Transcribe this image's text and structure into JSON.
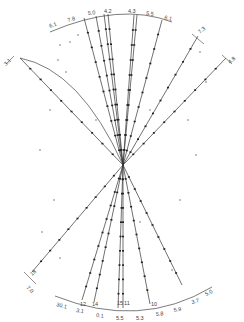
{
  "diagram": {
    "type": "track-fan",
    "vertex": {
      "x": 123,
      "y": 165
    },
    "stroke_color": "#333333",
    "dot_color": "#222222",
    "top_arc_labels": [
      "6.1",
      "7.8",
      "5.0",
      "4.2",
      "4.3",
      "5.5",
      "6.1"
    ],
    "bottom_arc_labels": [
      "30.1",
      "3.1",
      "0.1",
      "5.5",
      "5.3",
      "5.8",
      "5.9",
      "3.7",
      "5.0"
    ],
    "side_labels": {
      "upper_left": "3.1",
      "upper_right_1": "7.3",
      "upper_right_2": "4.8",
      "lower_left_1": "18",
      "lower_left_2": "7.0"
    },
    "inner_bottom_labels": [
      "12",
      "14",
      "15",
      "11",
      "10"
    ],
    "tracks_top": [
      {
        "x": 84,
        "y": 18
      },
      {
        "x": 96,
        "y": 16
      },
      {
        "x": 104,
        "y": 14
      },
      {
        "x": 108,
        "y": 14
      },
      {
        "x": 134,
        "y": 15
      },
      {
        "x": 137,
        "y": 15
      },
      {
        "x": 162,
        "y": 20
      },
      {
        "x": 198,
        "y": 36
      },
      {
        "x": 226,
        "y": 58
      },
      {
        "x": 20,
        "y": 58
      }
    ],
    "tracks_bottom": [
      {
        "x": 82,
        "y": 300
      },
      {
        "x": 94,
        "y": 302
      },
      {
        "x": 118,
        "y": 308
      },
      {
        "x": 123,
        "y": 308
      },
      {
        "x": 150,
        "y": 304
      },
      {
        "x": 182,
        "y": 285
      },
      {
        "x": 32,
        "y": 272
      }
    ]
  }
}
